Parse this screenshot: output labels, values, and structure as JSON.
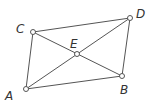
{
  "diagram": {
    "type": "parallelogram-with-diagonals",
    "points": [
      {
        "name": "A",
        "x": 26,
        "y": 89,
        "label_x": 5,
        "label_y": 100
      },
      {
        "name": "B",
        "x": 122,
        "y": 76,
        "label_x": 120,
        "label_y": 94
      },
      {
        "name": "C",
        "x": 33,
        "y": 32,
        "label_x": 16,
        "label_y": 33
      },
      {
        "name": "D",
        "x": 130,
        "y": 18,
        "label_x": 136,
        "label_y": 18
      },
      {
        "name": "E",
        "x": 77,
        "y": 54,
        "label_x": 70,
        "label_y": 48
      }
    ],
    "edges": [
      [
        "A",
        "C"
      ],
      [
        "C",
        "D"
      ],
      [
        "D",
        "B"
      ],
      [
        "B",
        "A"
      ],
      [
        "A",
        "D"
      ],
      [
        "C",
        "B"
      ]
    ],
    "line_color": "#555555"
  }
}
